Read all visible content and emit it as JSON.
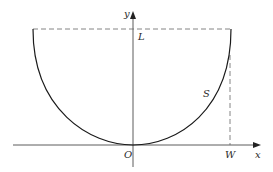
{
  "diagram": {
    "type": "coordinate-sketch",
    "axes": {
      "x_label": "x",
      "y_label": "y",
      "origin_label": "O"
    },
    "labels": {
      "top_level": "L",
      "curve": "S",
      "width_mark": "W"
    },
    "colors": {
      "line": "#1a1a1a",
      "dashed": "#555555",
      "background": "#ffffff"
    }
  }
}
